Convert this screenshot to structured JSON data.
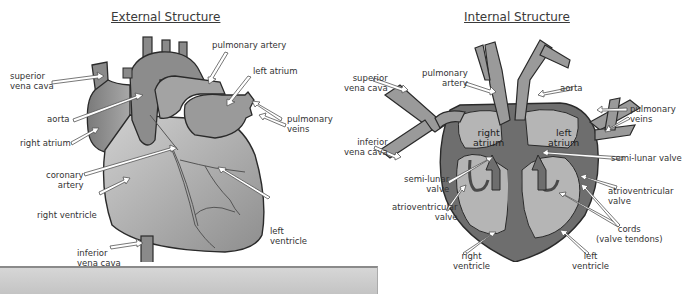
{
  "external": {
    "title": "External Structure",
    "labels": {
      "superior_vena_cava": "superior\nvena cava",
      "aorta": "aorta",
      "right_atrium": "right atrium",
      "coronary_artery": "coronary\nartery",
      "right_ventricle": "right ventricle",
      "inferior_vena_cava": "inferior\nvena cava",
      "pulmonary_artery": "pulmonary artery",
      "left_atrium": "left atrium",
      "pulmonary_veins": "pulmonary\nveins",
      "left_ventricle": "left\nventricle"
    }
  },
  "internal": {
    "title": "Internal Structure",
    "labels": {
      "superior_vena_cava": "superior\nvena cava",
      "pulmonary_artery": "pulmonary\nartery",
      "aorta": "aorta",
      "pulmonary_veins": "pulmonary\nveins",
      "inferior_vena_cava": "inferior\nvena cava",
      "right_atrium": "right\natrium",
      "left_atrium": "left\natrium",
      "semi_lunar_valve_right": "semi-lunar valve",
      "semi_lunar_valve_left": "semi-lunar\nvalve",
      "atrioventricular_valve_right": "atrioventricular\nvalve",
      "atrioventricular_valve_left": "atrioventricular\nvalve",
      "cords": "cords\n(valve tendons)",
      "right_ventricle": "right\nventricle",
      "left_ventricle": "left\nventricle"
    }
  },
  "colors": {
    "dark_vessel": "#6e6e6e",
    "mid_fill": "#9a9a9a",
    "light_fill": "#bdbdbd",
    "outline": "#2a2a2a",
    "bottom_bar": "#cccccc"
  }
}
